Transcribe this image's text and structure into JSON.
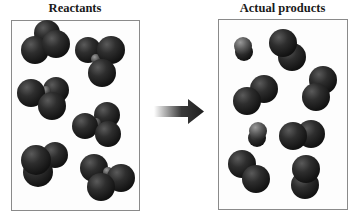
{
  "diagram": {
    "left_panel": {
      "title": "Reactants",
      "molecules": [
        {
          "type": "tetra-with-light-center",
          "count_dark": 3,
          "count_light": 1
        },
        {
          "type": "tetra-with-light-center",
          "count_dark": 3,
          "count_light": 1
        },
        {
          "type": "tetra-with-light-center",
          "count_dark": 3,
          "count_light": 1
        },
        {
          "type": "tetra-with-light-center",
          "count_dark": 3,
          "count_light": 1
        },
        {
          "type": "triatomic-dark",
          "count_dark": 3,
          "count_light": 0
        },
        {
          "type": "tetra-with-light-center",
          "count_dark": 3,
          "count_light": 1
        }
      ]
    },
    "arrow": {
      "direction": "right",
      "color": "#2a2a2a"
    },
    "right_panel": {
      "title": "Actual products",
      "molecules": [
        {
          "type": "diatomic-light-small"
        },
        {
          "type": "diatomic-dark"
        },
        {
          "type": "diatomic-dark"
        },
        {
          "type": "diatomic-dark"
        },
        {
          "type": "diatomic-light-small"
        },
        {
          "type": "diatomic-dark"
        },
        {
          "type": "diatomic-dark"
        },
        {
          "type": "diatomic-dark"
        }
      ]
    },
    "colors": {
      "atom_dark": "#2b2b2b",
      "atom_light": "#6a6a6a",
      "border": "#8a8a8a"
    }
  }
}
